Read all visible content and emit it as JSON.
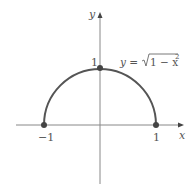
{
  "diagram": {
    "type": "graph",
    "axes": {
      "x_label": "x",
      "y_label": "y"
    },
    "tick_labels": {
      "x_neg": "−1",
      "x_pos": "1",
      "y_pos": "1"
    },
    "curve": {
      "equation_lhs": "y = ",
      "equation_radicand": "1 − x",
      "equation_exponent": "2",
      "description": "upper semicircle of unit circle",
      "points": [
        {
          "x": -1,
          "y": 0
        },
        {
          "x": 0,
          "y": 1
        },
        {
          "x": 1,
          "y": 0
        }
      ]
    },
    "colors": {
      "curve": "#555555",
      "axis": "#777777",
      "point": "#444444"
    }
  }
}
